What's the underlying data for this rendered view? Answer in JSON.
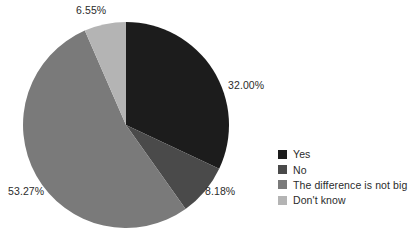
{
  "chart_data": {
    "type": "pie",
    "title": "",
    "subtitle": "",
    "xlabel": "",
    "ylabel": "",
    "grid": false,
    "legend_position": "right",
    "start_angle_deg": 0,
    "direction": "clockwise",
    "categories": [
      "Yes",
      "No",
      "The difference is not big",
      "Don't know"
    ],
    "values": [
      32.0,
      8.18,
      53.27,
      6.55
    ],
    "value_labels": [
      "32.00%",
      "8.18%",
      "53.27%",
      "6.55%"
    ],
    "colors": [
      "#1c1c1c",
      "#4a4a4a",
      "#7a7a7a",
      "#b4b4b4"
    ],
    "slices": [
      {
        "label": "Yes",
        "value": 32.0,
        "display": "32.00%",
        "color": "#1c1c1c"
      },
      {
        "label": "No",
        "value": 8.18,
        "display": "8.18%",
        "color": "#4a4a4a"
      },
      {
        "label": "The difference is not big",
        "value": 53.27,
        "display": "53.27%",
        "color": "#7a7a7a"
      },
      {
        "label": "Don't know",
        "value": 6.55,
        "display": "6.55%",
        "color": "#b4b4b4"
      }
    ]
  },
  "labels": {
    "yes": "32.00%",
    "no": "8.18%",
    "difference": "53.27%",
    "dont_know": "6.55%"
  },
  "legend": {
    "items": [
      {
        "label": "Yes",
        "color": "#1c1c1c"
      },
      {
        "label": "No",
        "color": "#4a4a4a"
      },
      {
        "label": "The difference is not big",
        "color": "#7a7a7a"
      },
      {
        "label": "Don't know",
        "color": "#b4b4b4"
      }
    ]
  },
  "style": {
    "background": "#ffffff",
    "text_color": "#2b2b2b"
  }
}
